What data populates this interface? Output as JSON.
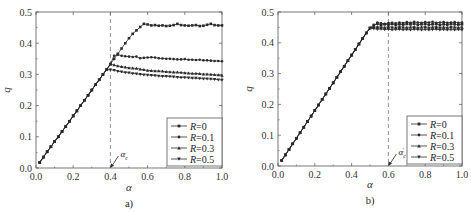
{
  "chart_data": [
    {
      "type": "line",
      "panel_label": "a)",
      "xlabel": "α",
      "ylabel": "q",
      "xlim": [
        0.0,
        1.0
      ],
      "ylim": [
        0.0,
        0.5
      ],
      "xticks": [
        "0.0",
        "0.2",
        "0.4",
        "0.6",
        "0.8",
        "1.0"
      ],
      "yticks": [
        "0.0",
        "0.1",
        "0.2",
        "0.3",
        "0.4",
        "0.5"
      ],
      "xtick_values": [
        0.0,
        0.2,
        0.4,
        0.6,
        0.8,
        1.0
      ],
      "ytick_values": [
        0.0,
        0.1,
        0.2,
        0.3,
        0.4,
        0.5
      ],
      "legend_position": "bottom-right",
      "grid": false,
      "vline": {
        "x": 0.4,
        "style": "dashed"
      },
      "annotation": {
        "text": "α",
        "sub": "c",
        "prime": false,
        "x": 0.4,
        "y": 0.0
      },
      "series": [
        {
          "name": "R=0",
          "label_prefix": "R",
          "label_value": "=0",
          "marker": "square",
          "x": [
            0.02,
            0.04,
            0.06,
            0.08,
            0.1,
            0.12,
            0.14,
            0.16,
            0.18,
            0.2,
            0.22,
            0.24,
            0.26,
            0.28,
            0.3,
            0.32,
            0.34,
            0.36,
            0.38,
            0.4,
            0.42,
            0.44,
            0.46,
            0.48,
            0.5,
            0.52,
            0.54,
            0.56,
            0.58,
            0.6,
            0.62,
            0.64,
            0.66,
            0.68,
            0.7,
            0.72,
            0.74,
            0.76,
            0.78,
            0.8,
            0.82,
            0.84,
            0.86,
            0.88,
            0.9,
            0.92,
            0.94,
            0.96,
            0.98,
            1.0
          ],
          "y": [
            0.018,
            0.035,
            0.052,
            0.068,
            0.085,
            0.1,
            0.117,
            0.133,
            0.15,
            0.167,
            0.183,
            0.2,
            0.217,
            0.233,
            0.25,
            0.267,
            0.283,
            0.3,
            0.316,
            0.333,
            0.35,
            0.366,
            0.383,
            0.4,
            0.416,
            0.43,
            0.441,
            0.452,
            0.462,
            0.46,
            0.457,
            0.458,
            0.456,
            0.457,
            0.455,
            0.456,
            0.458,
            0.462,
            0.458,
            0.457,
            0.456,
            0.457,
            0.458,
            0.455,
            0.456,
            0.459,
            0.462,
            0.458,
            0.457,
            0.457
          ]
        },
        {
          "name": "R=0.1",
          "label_prefix": "R",
          "label_value": "=0.1",
          "marker": "circle",
          "x": [
            0.02,
            0.04,
            0.06,
            0.08,
            0.1,
            0.12,
            0.14,
            0.16,
            0.18,
            0.2,
            0.22,
            0.24,
            0.26,
            0.28,
            0.3,
            0.32,
            0.34,
            0.36,
            0.38,
            0.4,
            0.42,
            0.44,
            0.46,
            0.48,
            0.5,
            0.52,
            0.54,
            0.56,
            0.58,
            0.6,
            0.62,
            0.64,
            0.66,
            0.68,
            0.7,
            0.72,
            0.74,
            0.76,
            0.78,
            0.8,
            0.82,
            0.84,
            0.86,
            0.88,
            0.9,
            0.92,
            0.94,
            0.96,
            0.98,
            1.0
          ],
          "y": [
            0.018,
            0.035,
            0.052,
            0.068,
            0.085,
            0.1,
            0.117,
            0.133,
            0.15,
            0.167,
            0.183,
            0.2,
            0.217,
            0.233,
            0.25,
            0.267,
            0.283,
            0.3,
            0.316,
            0.333,
            0.36,
            0.363,
            0.36,
            0.358,
            0.357,
            0.356,
            0.357,
            0.352,
            0.353,
            0.354,
            0.355,
            0.354,
            0.352,
            0.351,
            0.35,
            0.35,
            0.349,
            0.348,
            0.348,
            0.349,
            0.347,
            0.347,
            0.346,
            0.347,
            0.345,
            0.345,
            0.344,
            0.343,
            0.343,
            0.342
          ]
        },
        {
          "name": "R=0.3",
          "label_prefix": "R",
          "label_value": "=0.3",
          "marker": "triangle-up",
          "x": [
            0.02,
            0.04,
            0.06,
            0.08,
            0.1,
            0.12,
            0.14,
            0.16,
            0.18,
            0.2,
            0.22,
            0.24,
            0.26,
            0.28,
            0.3,
            0.32,
            0.34,
            0.36,
            0.38,
            0.4,
            0.42,
            0.44,
            0.46,
            0.48,
            0.5,
            0.52,
            0.54,
            0.56,
            0.58,
            0.6,
            0.62,
            0.64,
            0.66,
            0.68,
            0.7,
            0.72,
            0.74,
            0.76,
            0.78,
            0.8,
            0.82,
            0.84,
            0.86,
            0.88,
            0.9,
            0.92,
            0.94,
            0.96,
            0.98,
            1.0
          ],
          "y": [
            0.018,
            0.035,
            0.052,
            0.068,
            0.085,
            0.1,
            0.117,
            0.133,
            0.15,
            0.167,
            0.183,
            0.2,
            0.217,
            0.233,
            0.25,
            0.267,
            0.283,
            0.3,
            0.316,
            0.333,
            0.33,
            0.327,
            0.325,
            0.323,
            0.321,
            0.32,
            0.319,
            0.317,
            0.315,
            0.313,
            0.312,
            0.311,
            0.311,
            0.31,
            0.309,
            0.308,
            0.307,
            0.307,
            0.306,
            0.305,
            0.304,
            0.303,
            0.303,
            0.302,
            0.301,
            0.301,
            0.3,
            0.299,
            0.298,
            0.297
          ]
        },
        {
          "name": "R=0.5",
          "label_prefix": "R",
          "label_value": "=0.5",
          "marker": "triangle-down",
          "x": [
            0.02,
            0.04,
            0.06,
            0.08,
            0.1,
            0.12,
            0.14,
            0.16,
            0.18,
            0.2,
            0.22,
            0.24,
            0.26,
            0.28,
            0.3,
            0.32,
            0.34,
            0.36,
            0.38,
            0.4,
            0.42,
            0.44,
            0.46,
            0.48,
            0.5,
            0.52,
            0.54,
            0.56,
            0.58,
            0.6,
            0.62,
            0.64,
            0.66,
            0.68,
            0.7,
            0.72,
            0.74,
            0.76,
            0.78,
            0.8,
            0.82,
            0.84,
            0.86,
            0.88,
            0.9,
            0.92,
            0.94,
            0.96,
            0.98,
            1.0
          ],
          "y": [
            0.018,
            0.035,
            0.052,
            0.068,
            0.085,
            0.1,
            0.117,
            0.133,
            0.15,
            0.167,
            0.183,
            0.2,
            0.217,
            0.233,
            0.25,
            0.267,
            0.283,
            0.3,
            0.316,
            0.315,
            0.313,
            0.31,
            0.308,
            0.306,
            0.305,
            0.303,
            0.302,
            0.3,
            0.299,
            0.298,
            0.297,
            0.296,
            0.295,
            0.294,
            0.294,
            0.293,
            0.292,
            0.291,
            0.29,
            0.29,
            0.289,
            0.288,
            0.288,
            0.287,
            0.286,
            0.286,
            0.285,
            0.284,
            0.283,
            0.282
          ]
        }
      ]
    },
    {
      "type": "line",
      "panel_label": "b)",
      "xlabel": "α",
      "ylabel": "q",
      "xlim": [
        0.0,
        1.0
      ],
      "ylim": [
        0.0,
        0.5
      ],
      "xticks": [
        "0.0",
        "0.2",
        "0.4",
        "0.6",
        "0.8",
        "1.0"
      ],
      "yticks": [
        "0.0",
        "0.1",
        "0.2",
        "0.3",
        "0.4",
        "0.5"
      ],
      "xtick_values": [
        0.0,
        0.2,
        0.4,
        0.6,
        0.8,
        1.0
      ],
      "ytick_values": [
        0.0,
        0.1,
        0.2,
        0.3,
        0.4,
        0.5
      ],
      "legend_position": "bottom-right",
      "grid": false,
      "vline": {
        "x": 0.6,
        "style": "dashed"
      },
      "annotation": {
        "text": "α",
        "sub": "c",
        "prime": true,
        "x": 0.6,
        "y": 0.0
      },
      "series": [
        {
          "name": "R=0",
          "label_prefix": "R",
          "label_value": "=0",
          "marker": "square",
          "x": [
            0.02,
            0.04,
            0.06,
            0.08,
            0.1,
            0.12,
            0.14,
            0.16,
            0.18,
            0.2,
            0.22,
            0.24,
            0.26,
            0.28,
            0.3,
            0.32,
            0.34,
            0.36,
            0.38,
            0.4,
            0.42,
            0.44,
            0.46,
            0.48,
            0.5,
            0.52,
            0.54,
            0.56,
            0.58,
            0.6,
            0.62,
            0.64,
            0.66,
            0.68,
            0.7,
            0.72,
            0.74,
            0.76,
            0.78,
            0.8,
            0.82,
            0.84,
            0.86,
            0.88,
            0.9,
            0.92,
            0.94,
            0.96,
            0.98,
            1.0
          ],
          "y": [
            0.018,
            0.036,
            0.054,
            0.072,
            0.09,
            0.108,
            0.126,
            0.144,
            0.162,
            0.18,
            0.198,
            0.216,
            0.234,
            0.252,
            0.27,
            0.288,
            0.306,
            0.324,
            0.342,
            0.36,
            0.378,
            0.396,
            0.414,
            0.432,
            0.448,
            0.458,
            0.462,
            0.457,
            0.46,
            0.459,
            0.461,
            0.458,
            0.46,
            0.459,
            0.461,
            0.46,
            0.462,
            0.459,
            0.46,
            0.461,
            0.459,
            0.46,
            0.461,
            0.458,
            0.46,
            0.459,
            0.461,
            0.46,
            0.459,
            0.46
          ]
        },
        {
          "name": "R=0.1",
          "label_prefix": "R",
          "label_value": "=0.1",
          "marker": "circle",
          "x": [
            0.02,
            0.04,
            0.06,
            0.08,
            0.1,
            0.12,
            0.14,
            0.16,
            0.18,
            0.2,
            0.22,
            0.24,
            0.26,
            0.28,
            0.3,
            0.32,
            0.34,
            0.36,
            0.38,
            0.4,
            0.42,
            0.44,
            0.46,
            0.48,
            0.5,
            0.52,
            0.54,
            0.56,
            0.58,
            0.6,
            0.62,
            0.64,
            0.66,
            0.68,
            0.7,
            0.72,
            0.74,
            0.76,
            0.78,
            0.8,
            0.82,
            0.84,
            0.86,
            0.88,
            0.9,
            0.92,
            0.94,
            0.96,
            0.98,
            1.0
          ],
          "y": [
            0.018,
            0.036,
            0.054,
            0.072,
            0.09,
            0.108,
            0.126,
            0.144,
            0.162,
            0.18,
            0.198,
            0.216,
            0.234,
            0.252,
            0.27,
            0.288,
            0.306,
            0.324,
            0.342,
            0.36,
            0.378,
            0.396,
            0.414,
            0.432,
            0.448,
            0.452,
            0.466,
            0.463,
            0.462,
            0.464,
            0.465,
            0.463,
            0.466,
            0.464,
            0.467,
            0.465,
            0.468,
            0.466,
            0.465,
            0.467,
            0.466,
            0.468,
            0.465,
            0.466,
            0.467,
            0.465,
            0.466,
            0.467,
            0.465,
            0.466
          ]
        },
        {
          "name": "R=0.3",
          "label_prefix": "R",
          "label_value": "=0.3",
          "marker": "triangle-up",
          "x": [
            0.02,
            0.04,
            0.06,
            0.08,
            0.1,
            0.12,
            0.14,
            0.16,
            0.18,
            0.2,
            0.22,
            0.24,
            0.26,
            0.28,
            0.3,
            0.32,
            0.34,
            0.36,
            0.38,
            0.4,
            0.42,
            0.44,
            0.46,
            0.48,
            0.5,
            0.52,
            0.54,
            0.56,
            0.58,
            0.6,
            0.62,
            0.64,
            0.66,
            0.68,
            0.7,
            0.72,
            0.74,
            0.76,
            0.78,
            0.8,
            0.82,
            0.84,
            0.86,
            0.88,
            0.9,
            0.92,
            0.94,
            0.96,
            0.98,
            1.0
          ],
          "y": [
            0.018,
            0.036,
            0.054,
            0.072,
            0.09,
            0.108,
            0.126,
            0.144,
            0.162,
            0.18,
            0.198,
            0.216,
            0.234,
            0.252,
            0.27,
            0.288,
            0.306,
            0.324,
            0.342,
            0.36,
            0.378,
            0.396,
            0.414,
            0.432,
            0.448,
            0.45,
            0.452,
            0.451,
            0.45,
            0.452,
            0.451,
            0.45,
            0.452,
            0.451,
            0.45,
            0.451,
            0.452,
            0.45,
            0.451,
            0.452,
            0.45,
            0.451,
            0.452,
            0.45,
            0.451,
            0.45,
            0.452,
            0.451,
            0.45,
            0.451
          ]
        },
        {
          "name": "R=0.5",
          "label_prefix": "R",
          "label_value": "=0.5",
          "marker": "triangle-down",
          "x": [
            0.02,
            0.04,
            0.06,
            0.08,
            0.1,
            0.12,
            0.14,
            0.16,
            0.18,
            0.2,
            0.22,
            0.24,
            0.26,
            0.28,
            0.3,
            0.32,
            0.34,
            0.36,
            0.38,
            0.4,
            0.42,
            0.44,
            0.46,
            0.48,
            0.5,
            0.52,
            0.54,
            0.56,
            0.58,
            0.6,
            0.62,
            0.64,
            0.66,
            0.68,
            0.7,
            0.72,
            0.74,
            0.76,
            0.78,
            0.8,
            0.82,
            0.84,
            0.86,
            0.88,
            0.9,
            0.92,
            0.94,
            0.96,
            0.98,
            1.0
          ],
          "y": [
            0.018,
            0.036,
            0.054,
            0.072,
            0.09,
            0.108,
            0.126,
            0.144,
            0.162,
            0.18,
            0.198,
            0.216,
            0.234,
            0.252,
            0.27,
            0.288,
            0.306,
            0.324,
            0.342,
            0.36,
            0.378,
            0.396,
            0.414,
            0.432,
            0.448,
            0.446,
            0.444,
            0.445,
            0.443,
            0.444,
            0.442,
            0.443,
            0.444,
            0.442,
            0.443,
            0.442,
            0.444,
            0.443,
            0.442,
            0.443,
            0.442,
            0.443,
            0.444,
            0.442,
            0.443,
            0.442,
            0.443,
            0.442,
            0.443,
            0.442
          ]
        }
      ]
    }
  ]
}
